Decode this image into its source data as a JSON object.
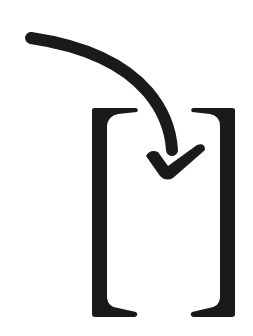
{
  "image": {
    "description": "Curved arrow pointing down into square brackets, ending in a checkmark-shaped arrowhead",
    "colors": {
      "background": "#ffffff",
      "ink": "#1a1a1a"
    },
    "elements": {
      "arrow": "curved-arrow-with-check-head",
      "left_bracket": "[",
      "right_bracket": "]"
    }
  }
}
